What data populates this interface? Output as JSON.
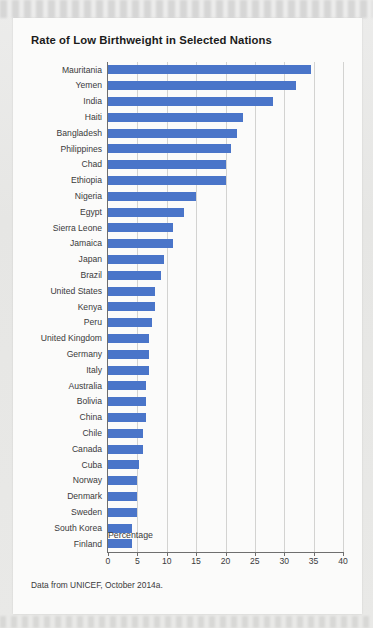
{
  "card": {
    "title": "Rate of Low Birthweight in Selected Nations",
    "source_note": "Data from UNICEF, October 2014a.",
    "bar_color": "#4a75c9",
    "background": "#fbfbfa"
  },
  "chart_data": {
    "type": "bar",
    "orientation": "horizontal",
    "title": "Rate of Low Birthweight in Selected Nations",
    "xlabel": "Percentage",
    "ylabel": "",
    "xlim": [
      0,
      40
    ],
    "xticks": [
      0,
      5,
      10,
      15,
      20,
      25,
      30,
      35,
      40
    ],
    "grid": true,
    "legend": false,
    "categories": [
      "Mauritania",
      "Yemen",
      "India",
      "Haiti",
      "Bangladesh",
      "Philippines",
      "Chad",
      "Ethiopia",
      "Nigeria",
      "Egypt",
      "Sierra Leone",
      "Jamaica",
      "Japan",
      "Brazil",
      "United States",
      "Kenya",
      "Peru",
      "United Kingdom",
      "Germany",
      "Italy",
      "Australia",
      "Bolivia",
      "China",
      "Chile",
      "Canada",
      "Cuba",
      "Norway",
      "Denmark",
      "Sweden",
      "South Korea",
      "Finland"
    ],
    "values": [
      34.5,
      32.0,
      28.0,
      23.0,
      22.0,
      21.0,
      20.0,
      20.0,
      15.0,
      13.0,
      11.0,
      11.0,
      9.6,
      9.0,
      8.0,
      8.0,
      7.5,
      7.0,
      7.0,
      7.0,
      6.5,
      6.5,
      6.5,
      6.0,
      6.0,
      5.3,
      5.0,
      5.0,
      5.0,
      4.0,
      4.0
    ],
    "source": "Data from UNICEF, October 2014a."
  }
}
